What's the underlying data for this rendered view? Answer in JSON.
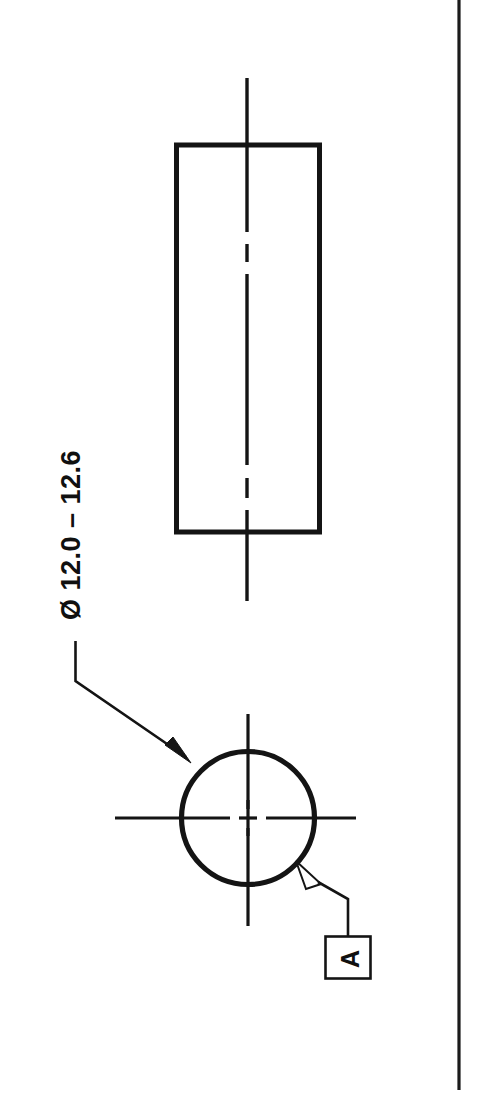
{
  "drawing": {
    "title": "Technical part drawing - cylindrical shaft",
    "background_color": "#ffffff",
    "line_color": "#101010",
    "sheet": {
      "border_label": "sheet-border-line"
    },
    "annotations": {
      "diameter_dimension": {
        "label": "Ø 12.0 – 12.6",
        "symbol": "diameter-symbol",
        "nominal_min": "12.0",
        "nominal_max": "12.6",
        "rotation_degrees": "-90"
      },
      "datum_feature": {
        "label": "A",
        "rotation_degrees": "-90"
      }
    },
    "views": {
      "front_view": {
        "name": "rectangular-side-view",
        "shape": "rectangle",
        "centerline": "vertical-dash-dot"
      },
      "end_view": {
        "name": "circular-end-view",
        "shape": "circle",
        "centerlines": "crosshair-dash-dot"
      }
    }
  }
}
